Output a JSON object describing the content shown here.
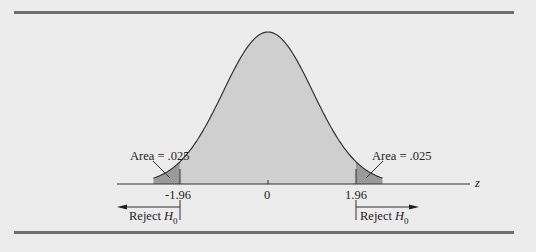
{
  "chart_data": {
    "type": "area",
    "title": "",
    "xlabel": "z",
    "ylabel": "",
    "x_ticks": [
      "-1.96",
      "0",
      "1.96"
    ],
    "critical_values": [
      -1.96,
      1.96
    ],
    "tail_areas": [
      0.025,
      0.025
    ],
    "annotations": {
      "left_area": "Area = .025",
      "right_area": "Area = .025",
      "left_reject": "Reject",
      "right_reject": "Reject",
      "hypothesis": "H",
      "hypothesis_sub": "0"
    },
    "grid": false
  },
  "colors": {
    "background": "#ececec",
    "curve_fill": "#cfcfcf",
    "tail_fill": "#9a9a9a",
    "rule": "#6e6e6e",
    "line": "#333333"
  }
}
